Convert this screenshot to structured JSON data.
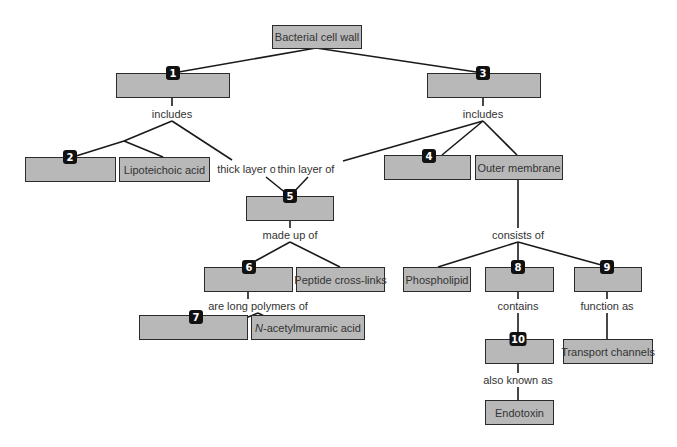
{
  "diagram": {
    "colors": {
      "node_fill": "#b8b8b8",
      "node_border": "#2b2b2b",
      "badge": "#111111",
      "line": "#1a1a1a",
      "text": "#333333"
    },
    "nodes": {
      "root": {
        "text": "Bacterial cell wall"
      },
      "n1": {
        "badge": "1",
        "text": ""
      },
      "n3": {
        "badge": "3",
        "text": ""
      },
      "n2": {
        "badge": "2",
        "text": ""
      },
      "lipoteichoic": {
        "text": "Lipoteichoic acid"
      },
      "n4": {
        "badge": "4",
        "text": ""
      },
      "outer_membrane": {
        "text": "Outer membrane"
      },
      "n5": {
        "badge": "5",
        "text": ""
      },
      "n6": {
        "badge": "6",
        "text": ""
      },
      "peptide": {
        "text": "Peptide cross-links"
      },
      "n7": {
        "badge": "7",
        "text": ""
      },
      "nacetyl": {
        "prefix": "N",
        "text": "-acetylmuramic acid"
      },
      "phospholipid": {
        "text": "Phospholipid"
      },
      "n8": {
        "badge": "8",
        "text": ""
      },
      "n9": {
        "badge": "9",
        "text": ""
      },
      "n10": {
        "badge": "10",
        "text": ""
      },
      "transport": {
        "text": "Transport channels"
      },
      "endotoxin": {
        "text": "Endotoxin"
      }
    },
    "link_labels": {
      "includes_left": "includes",
      "includes_right": "includes",
      "thick_layer": "thick layer of",
      "thin_layer": "thin layer of",
      "made_up_of": "made up of",
      "long_polymers": "are long polymers of",
      "consists_of": "consists of",
      "contains": "contains",
      "function_as": "function as",
      "also_known_as": "also known as"
    }
  }
}
